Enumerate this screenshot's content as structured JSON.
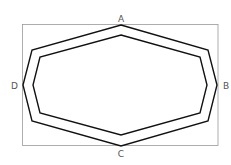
{
  "diagram": {
    "labels": {
      "a": "A",
      "b": "B",
      "c": "C",
      "d": "D"
    },
    "colors": {
      "rect": "#888888",
      "polygon": "#111111",
      "label": "#555555"
    }
  }
}
